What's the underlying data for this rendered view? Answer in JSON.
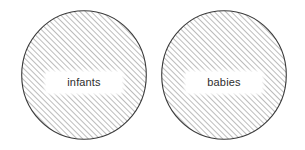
{
  "canvas": {
    "width": 305,
    "height": 150,
    "background_color": "#ffffff"
  },
  "diagram": {
    "type": "venn-two-disjoint-sets",
    "hatch_color": "#8a8a8a",
    "outline_color": "#3a3a3a",
    "label_background_color": "#ffffff",
    "label_text_color": "#2e2e2e",
    "sets": [
      {
        "id": "set-infants",
        "label": "infants",
        "shape": "circle"
      },
      {
        "id": "set-babies",
        "label": "babies",
        "shape": "circle"
      }
    ]
  }
}
